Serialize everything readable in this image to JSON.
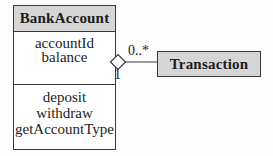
{
  "diagram": {
    "type": "uml-class-diagram",
    "classes": {
      "bank_account": {
        "name": "BankAccount",
        "attributes": [
          "accountId",
          "balance"
        ],
        "methods": [
          "deposit",
          "withdraw",
          "getAccountType"
        ]
      },
      "transaction": {
        "name": "Transaction"
      }
    },
    "relationship": {
      "type": "aggregation",
      "from": "BankAccount",
      "to": "Transaction",
      "multiplicity_transaction_end": "0..*",
      "multiplicity_bankaccount_end": "1"
    },
    "colors": {
      "compartment_header_fill": "#d6d6d6",
      "compartment_body_fill": "#ffffff",
      "border": "#3a3a3a",
      "background": "#fdfdfd"
    }
  }
}
